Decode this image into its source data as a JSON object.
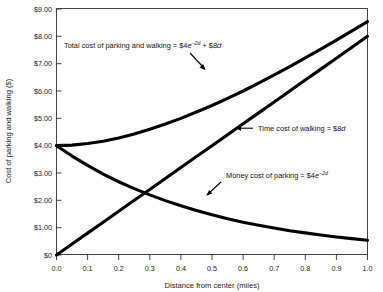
{
  "chart_data": {
    "type": "line",
    "title": "",
    "xlabel": "Distance from center (miles)",
    "ylabel": "Cost of parking and walking ($)",
    "xlim": [
      0.0,
      1.0
    ],
    "ylim": [
      0.0,
      9.0
    ],
    "grid": false,
    "legend_position": "inline-annotations",
    "x_tick_labels": [
      "0.0",
      "0.1",
      "0.2",
      "0.3",
      "0.4",
      "0.5",
      "0.6",
      "0.7",
      "0.8",
      "0.9",
      "1.0"
    ],
    "x_ticks": [
      0.0,
      0.1,
      0.2,
      0.3,
      0.4,
      0.5,
      0.6,
      0.7,
      0.8,
      0.9,
      1.0
    ],
    "y_tick_labels": [
      "$0",
      "$1.00",
      "$2.00",
      "$3.00",
      "$4.00",
      "$5.00",
      "$6.00",
      "$7.00",
      "$8.00",
      "$9.00"
    ],
    "y_ticks": [
      0,
      1,
      2,
      3,
      4,
      5,
      6,
      7,
      8,
      9
    ],
    "x": [
      0.0,
      0.05,
      0.1,
      0.15,
      0.2,
      0.25,
      0.3,
      0.35,
      0.4,
      0.45,
      0.5,
      0.55,
      0.6,
      0.65,
      0.7,
      0.75,
      0.8,
      0.85,
      0.9,
      0.95,
      1.0
    ],
    "series": [
      {
        "name": "Total cost of parking and walking",
        "formula": "$4e^(-2d) + $8d",
        "values": [
          4.0,
          4.02,
          4.08,
          4.16,
          4.28,
          4.43,
          4.6,
          4.79,
          5.0,
          5.23,
          5.47,
          5.73,
          6.0,
          6.29,
          6.59,
          6.89,
          7.21,
          7.53,
          7.86,
          8.2,
          8.54
        ]
      },
      {
        "name": "Time cost of walking",
        "formula": "$8d",
        "values": [
          0.0,
          0.4,
          0.8,
          1.2,
          1.6,
          2.0,
          2.4,
          2.8,
          3.2,
          3.6,
          4.0,
          4.4,
          4.8,
          5.2,
          5.6,
          6.0,
          6.4,
          6.8,
          7.2,
          7.6,
          8.0
        ]
      },
      {
        "name": "Money cost of parking",
        "formula": "$4e^(-2d)",
        "values": [
          4.0,
          3.62,
          3.28,
          2.96,
          2.68,
          2.43,
          2.2,
          1.99,
          1.8,
          1.63,
          1.47,
          1.33,
          1.2,
          1.09,
          0.99,
          0.89,
          0.81,
          0.73,
          0.66,
          0.6,
          0.54
        ]
      }
    ],
    "annotations": [
      {
        "id": "total-cost",
        "prefix": "Total cost of parking and walking = $4",
        "base": "e",
        "exponent": "−2d",
        "suffix_plain": " + $8",
        "suffix_italic": "d",
        "arrow": "down-right"
      },
      {
        "id": "time-cost",
        "prefix": "Time cost of walking = $8",
        "base": "",
        "exponent": "",
        "suffix_plain": "",
        "suffix_italic": "d",
        "arrow": "left"
      },
      {
        "id": "money-cost",
        "prefix": "Money cost of parking = $4",
        "base": "e",
        "exponent": "−2d",
        "suffix_plain": "",
        "suffix_italic": "",
        "arrow": "down-left"
      }
    ]
  }
}
